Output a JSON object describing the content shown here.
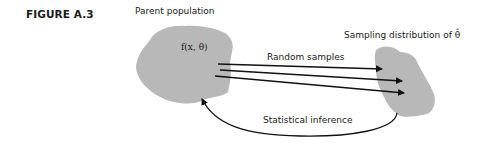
{
  "figure": {
    "label": "FIGURE A.3"
  },
  "nodes": {
    "parent": {
      "title": "Parent population",
      "function_label": "f(x, θ)",
      "fill": "#b8b8b8"
    },
    "sampling": {
      "title": "Sampling distribution of θ̂",
      "fill": "#b8b8b8"
    }
  },
  "edges": {
    "random_samples": {
      "label": "Random samples",
      "count": 3
    },
    "statistical_inference": {
      "label": "Statistical inference"
    }
  },
  "colors": {
    "blob": "#b8b8b8",
    "arrow": "#111111",
    "text": "#1a1a1a"
  }
}
